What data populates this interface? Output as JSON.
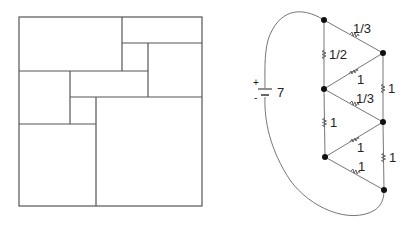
{
  "figures": {
    "rectangle_tiling": {
      "description": "Rectangle subdivided into rectangles",
      "outer": {
        "x": 19,
        "y": 17,
        "w": 183,
        "h": 189
      },
      "segments": [
        [
          122,
          17,
          122,
          71
        ],
        [
          122,
          43,
          202,
          43
        ],
        [
          148,
          43,
          148,
          97
        ],
        [
          19,
          71,
          148,
          71
        ],
        [
          70,
          71,
          70,
          124
        ],
        [
          70,
          97,
          202,
          97
        ],
        [
          96,
          97,
          96,
          206
        ],
        [
          19,
          124,
          96,
          124
        ]
      ]
    },
    "circuit": {
      "battery": {
        "label": "7",
        "plus": "+",
        "minus": "-"
      },
      "nodes": [
        {
          "id": "a",
          "x": 324,
          "y": 20
        },
        {
          "id": "b",
          "x": 383,
          "y": 53
        },
        {
          "id": "c",
          "x": 324,
          "y": 89
        },
        {
          "id": "d",
          "x": 383,
          "y": 122
        },
        {
          "id": "e",
          "x": 325,
          "y": 157
        },
        {
          "id": "f",
          "x": 384,
          "y": 190
        }
      ],
      "resistors": [
        {
          "from": "a",
          "to": "b",
          "label": "1/3"
        },
        {
          "from": "a",
          "to": "c",
          "label": "1/2"
        },
        {
          "from": "c",
          "to": "b",
          "label": "1"
        },
        {
          "from": "b",
          "to": "d",
          "label": "1"
        },
        {
          "from": "c",
          "to": "d",
          "label": "1/3"
        },
        {
          "from": "c",
          "to": "e",
          "label": "1"
        },
        {
          "from": "e",
          "to": "d",
          "label": "1"
        },
        {
          "from": "d",
          "to": "f",
          "label": "1"
        },
        {
          "from": "e",
          "to": "f",
          "label": "1"
        }
      ]
    }
  }
}
